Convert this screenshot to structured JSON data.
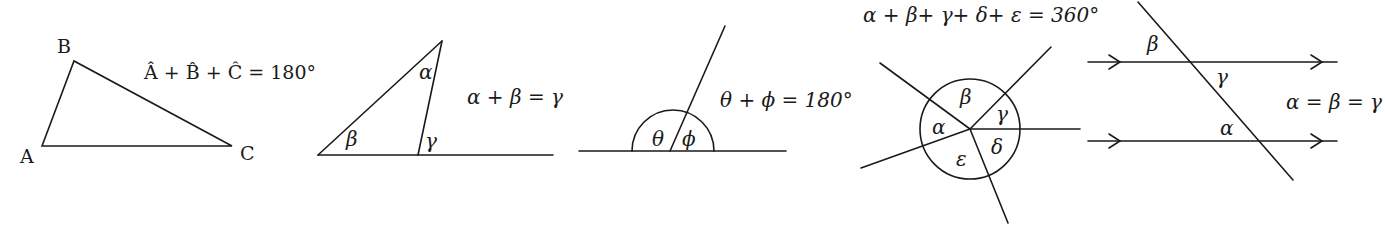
{
  "diagrams": {
    "triangle_sum": {
      "vertex_labels": {
        "A": "A",
        "B": "B",
        "C": "C"
      },
      "equation": "Â + B̂ + Ĉ = 180°"
    },
    "exterior_angle": {
      "angle_labels": {
        "alpha": "α",
        "beta": "β",
        "gamma": "γ"
      },
      "equation": "α + β = γ"
    },
    "straight_line": {
      "angle_labels": {
        "theta": "θ",
        "phi": "ϕ"
      },
      "equation": "θ + ϕ = 180°"
    },
    "angles_at_point": {
      "equation": "α + β+ γ+ δ+ ε = 360°",
      "angle_labels": {
        "alpha": "α",
        "beta": "β",
        "gamma": "γ",
        "delta": "δ",
        "epsilon": "ε"
      }
    },
    "parallel_lines": {
      "angle_labels": {
        "alpha": "α",
        "beta": "β",
        "gamma": "γ"
      },
      "equation": "α = β = γ"
    }
  }
}
